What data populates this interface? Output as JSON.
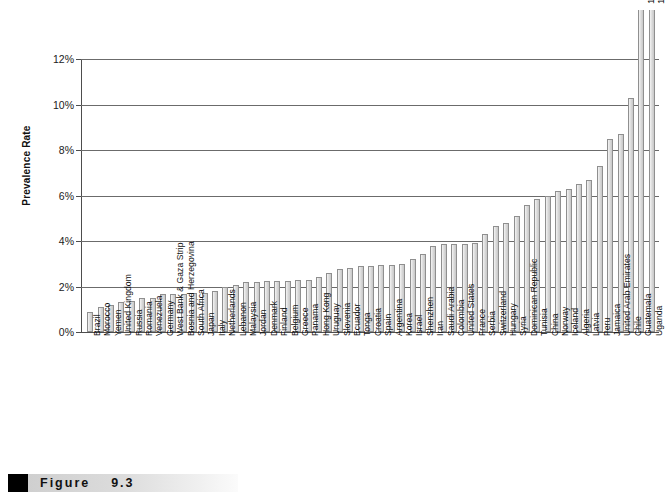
{
  "figure": {
    "caption_label": "Figure",
    "caption_number": "9.3"
  },
  "chart_data": {
    "type": "bar",
    "title": "",
    "subtitle": "",
    "xlabel": "",
    "ylabel": "Prevalence Rate",
    "ylim": [
      0,
      12
    ],
    "yticks": [
      "0%",
      "2%",
      "4%",
      "6%",
      "8%",
      "10%",
      "12%"
    ],
    "ytick_values": [
      0,
      2,
      4,
      6,
      8,
      10,
      12
    ],
    "grid": "horizontal",
    "legend": "none",
    "units": "percent",
    "categories": [
      "Brazil",
      "Morocco",
      "Yemen",
      "United Kingdom",
      "Russia",
      "Romania",
      "Venezuela",
      "Germany",
      "West Bank & Gaza Strip",
      "Bosnia and Herzegovina",
      "South Africa",
      "Japan",
      "Italy",
      "Netherlands",
      "Lebanon",
      "Malaysia",
      "Jordan",
      "Denmark",
      "Finland",
      "Belgium",
      "Greece",
      "Panama",
      "Hong Kong",
      "Uruguay",
      "Slovenia",
      "Ecuador",
      "Tonga",
      "Croatia",
      "Spain",
      "Argentina",
      "Korea",
      "Israel",
      "Shenzhen",
      "Iran",
      "Saudi Arabia",
      "Colombia",
      "United States",
      "France",
      "Serbia",
      "Switzerland",
      "Hungary",
      "Syria",
      "Dominican Republic",
      "Tunisia",
      "China",
      "Norway",
      "Iceland",
      "Algeria",
      "Latvia",
      "Peru",
      "Jamaica",
      "United Arab Emirates",
      "Chile",
      "Guatemala",
      "Uganda"
    ],
    "values": [
      0.9,
      1.1,
      1.2,
      1.3,
      1.35,
      1.5,
      1.5,
      1.65,
      1.65,
      1.65,
      1.7,
      1.7,
      1.8,
      2.0,
      2.05,
      2.2,
      2.2,
      2.25,
      2.25,
      2.25,
      2.3,
      2.3,
      2.4,
      2.6,
      2.75,
      2.8,
      2.9,
      2.9,
      2.95,
      2.95,
      3.0,
      3.2,
      3.45,
      3.8,
      3.85,
      3.85,
      3.85,
      3.9,
      4.3,
      4.65,
      4.8,
      5.1,
      5.6,
      5.85,
      6.0,
      6.2,
      6.3,
      6.5,
      6.7,
      7.3,
      8.5,
      8.7,
      10.3,
      12.2,
      18.6
    ],
    "value_labels": [
      {
        "category": "Guatemala",
        "index": 53,
        "text": "12.2 %"
      },
      {
        "category": "Uganda",
        "index": 54,
        "text": "18.6 %"
      }
    ]
  },
  "colors": {
    "bar_fill": "#dcdcdc",
    "bar_border": "#8f8f8f",
    "gridline": "#6b6b6b",
    "axis": "#4d4d4d",
    "text": "#111111",
    "caption_square": "#000000"
  }
}
